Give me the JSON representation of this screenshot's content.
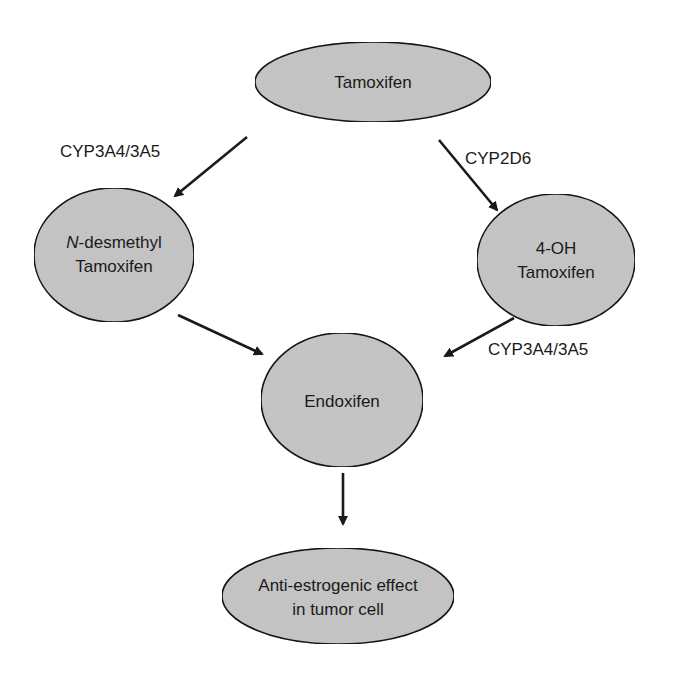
{
  "diagram": {
    "type": "metabolic-pathway",
    "colors": {
      "node_fill": "#c9c9c9",
      "node_stroke": "#1a1a1a",
      "edge": "#1a1a1a",
      "background": "#ffffff"
    },
    "nodes": {
      "tamoxifen": {
        "line1": "Tamoxifen"
      },
      "ndesmethyl": {
        "line1_italic": "N",
        "line1_rest": "-desmethyl",
        "line2": "Tamoxifen"
      },
      "hydroxy": {
        "line1": "4-OH",
        "line2": "Tamoxifen"
      },
      "endoxifen": {
        "line1": "Endoxifen"
      },
      "effect": {
        "line1": "Anti-estrogenic effect",
        "line2": "in tumor cell"
      }
    },
    "edges": [
      {
        "from": "Tamoxifen",
        "to": "N-desmethyl Tamoxifen",
        "label": "CYP3A4/3A5"
      },
      {
        "from": "Tamoxifen",
        "to": "4-OH Tamoxifen",
        "label": "CYP2D6"
      },
      {
        "from": "N-desmethyl Tamoxifen",
        "to": "Endoxifen",
        "label": ""
      },
      {
        "from": "4-OH Tamoxifen",
        "to": "Endoxifen",
        "label": "CYP3A4/3A5"
      },
      {
        "from": "Endoxifen",
        "to": "Anti-estrogenic effect in tumor cell",
        "label": ""
      }
    ]
  }
}
